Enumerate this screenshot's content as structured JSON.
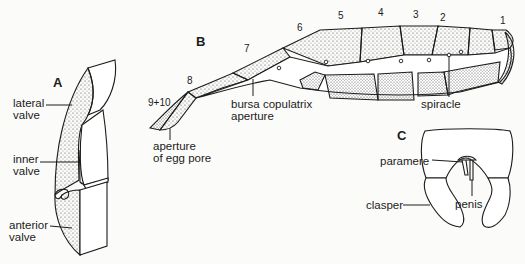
{
  "figure": {
    "panels": [
      {
        "id": "A",
        "label": "A",
        "annotations": [
          "lateral\nvalve",
          "inner\nvalve",
          "anterior\nvalve"
        ]
      },
      {
        "id": "B",
        "label": "B",
        "segment_numbers": [
          "1",
          "2",
          "3",
          "4",
          "5",
          "6",
          "7",
          "8",
          "9+10"
        ],
        "annotations": [
          "bursa copulatrix\naperture",
          "aperture\nof egg pore",
          "spiracle"
        ]
      },
      {
        "id": "C",
        "label": "C",
        "annotations": [
          "paramere",
          "clasper",
          "penis"
        ]
      }
    ]
  },
  "colors": {
    "ink": "#1c1c1c",
    "paper": "#fbfbf9",
    "stipple": "#3a3a3a"
  }
}
